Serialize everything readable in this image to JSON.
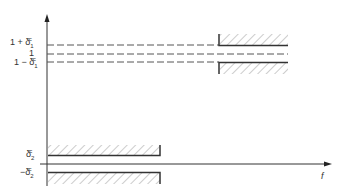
{
  "diagram": {
    "type": "filter-specification-template",
    "x_axis_label": "f",
    "y_axis_labels": {
      "upper_pass": {
        "prefix": "1 + δ",
        "sub": "1",
        "sup": "c"
      },
      "unity": "1",
      "lower_pass": {
        "prefix": "1 − δ",
        "sub": "1",
        "sup": "c"
      },
      "stop_pos": {
        "prefix": "δ",
        "sub": "2",
        "sup": "c"
      },
      "stop_neg": {
        "prefix": "−δ",
        "sub": "2",
        "sup": "c"
      }
    },
    "regions": [
      {
        "name": "stopband",
        "x_start": 44,
        "x_end": 160,
        "upper": 155,
        "lower": 172
      },
      {
        "name": "passband",
        "x_start": 219,
        "x_end": 288,
        "upper": 46,
        "lower": 62
      }
    ],
    "colors": {
      "line": "#333333",
      "hatch": "#888888",
      "dash": "#555555"
    }
  }
}
